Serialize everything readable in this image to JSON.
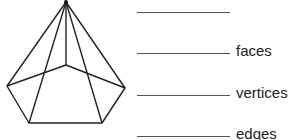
{
  "figure": {
    "name": "pentagonal pyramid",
    "stroke_color": "#222222",
    "vertices": {
      "apex": [
        66,
        2
      ],
      "back": [
        66,
        65
      ],
      "left": [
        7,
        86
      ],
      "right": [
        125,
        88
      ],
      "front_left": [
        29,
        123
      ],
      "front_right": [
        102,
        123
      ]
    }
  },
  "answers": [
    {
      "label": "",
      "value": ""
    },
    {
      "label": "faces",
      "value": ""
    },
    {
      "label": "vertices",
      "value": ""
    },
    {
      "label": "edges",
      "value": ""
    }
  ]
}
